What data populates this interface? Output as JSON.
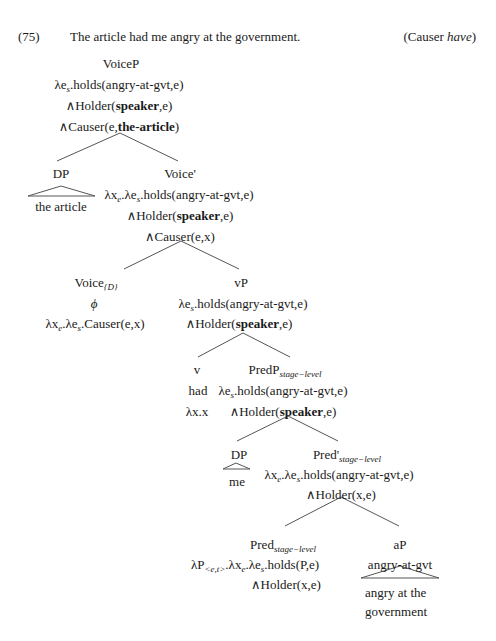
{
  "example": {
    "number": "(75)",
    "sentence": "The article had me angry at the government.",
    "label_prefix": "(Causer ",
    "label_italic": "have",
    "label_suffix": ")"
  },
  "tree": {
    "voiceP": {
      "label": "VoiceP",
      "line1_pre": "λe",
      "line1_sub": "s",
      "line1_post": ".holds(angry-at-gvt,e)",
      "line2_pre": "∧Holder(",
      "line2_bold": "speaker",
      "line2_post": ",e)",
      "line3_pre": "∧Causer(e,",
      "line3_bold": "the-article",
      "line3_post": ")"
    },
    "dp_subject": {
      "label": "DP",
      "text": "the article"
    },
    "voice_bar": {
      "label": "Voice'",
      "line1_a": "λx",
      "line1_sub_a": "e",
      "line1_b": ".λe",
      "line1_sub_b": "s",
      "line1_c": ".holds(angry-at-gvt,e)",
      "line2_pre": "∧Holder(",
      "line2_bold": "speaker",
      "line2_post": ",e)",
      "line3": "∧Causer(e,x)"
    },
    "voice_head": {
      "label": "Voice",
      "label_sub": "{D}",
      "phon": "ϕ",
      "sem_a": "λx",
      "sem_sub_a": "e",
      "sem_b": ".λe",
      "sem_sub_b": "s",
      "sem_c": ".Causer(e,x)"
    },
    "vP": {
      "label": "vP",
      "line1_pre": "λe",
      "line1_sub": "s",
      "line1_post": ".holds(angry-at-gvt,e)",
      "line2_pre": "∧Holder(",
      "line2_bold": "speaker",
      "line2_post": ",e)"
    },
    "v_head": {
      "label": "v",
      "phon": "had",
      "sem": "λx.x"
    },
    "predP": {
      "label": "PredP",
      "label_sub": "stage−level",
      "line1_pre": "λe",
      "line1_sub": "s",
      "line1_post": ".holds(angry-at-gvt,e)",
      "line2_pre": "∧Holder(",
      "line2_bold": "speaker",
      "line2_post": ",e)"
    },
    "dp_object": {
      "label": "DP",
      "text": "me"
    },
    "pred_bar": {
      "label": "Pred'",
      "label_sub": "stage−level",
      "line1_a": "λx",
      "line1_sub_a": "e",
      "line1_b": ".λe",
      "line1_sub_b": "s",
      "line1_c": ".holds(angry-at-gvt,e)",
      "line2": "∧Holder(x,e)"
    },
    "pred_head": {
      "label": "Pred",
      "label_sub": "stage−level",
      "line1_a": "λP",
      "line1_sub_a": "<e,t>",
      "line1_b": ".λx",
      "line1_sub_b": "e",
      "line1_c": ".λe",
      "line1_sub_c": "s",
      "line1_d": ".holds(P,e)",
      "line2": "∧Holder(x,e)"
    },
    "aP": {
      "label": "aP",
      "sem": "angry-at-gvt",
      "text_line1": "angry at the",
      "text_line2": "government"
    }
  }
}
